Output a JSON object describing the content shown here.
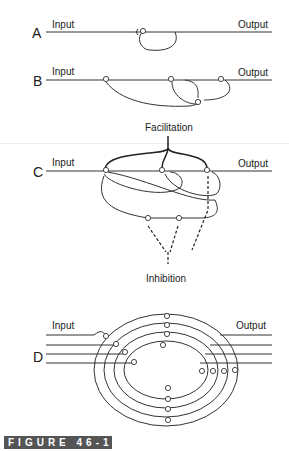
{
  "figure": {
    "caption": "FIGURE 46-14",
    "panels": [
      {
        "letter": "A",
        "input_label": "Input",
        "output_label": "Output"
      },
      {
        "letter": "B",
        "input_label": "Input",
        "output_label": "Output"
      },
      {
        "letter": "C",
        "input_label": "Input",
        "output_label": "Output",
        "top_label": "Facilitation",
        "bottom_label": "Inhibition"
      },
      {
        "letter": "D",
        "input_label": "Input",
        "output_label": "Output"
      }
    ]
  },
  "colors": {
    "line": "#333333",
    "caption_bg": "#555555",
    "caption_text": "#ffffff"
  }
}
